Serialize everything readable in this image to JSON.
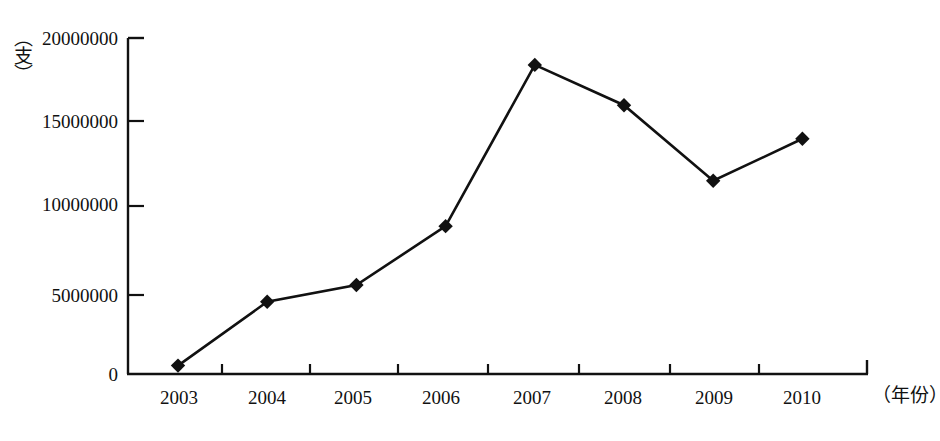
{
  "figure": {
    "background": "#ffffff",
    "ink_color": "#111111",
    "scan_artifact_top": "……………………………………",
    "scan_artifact_bottom": "………………………………………………………………"
  },
  "chart_data": {
    "type": "line",
    "title": "",
    "subtitle": "",
    "xlabel": "（年份）",
    "ylabel": "（支）",
    "categories": [
      "2003",
      "2004",
      "2005",
      "2006",
      "2007",
      "2008",
      "2009",
      "2010"
    ],
    "values": [
      500000,
      4300000,
      5300000,
      8800000,
      18400000,
      16000000,
      11500000,
      14000000
    ],
    "series": [
      {
        "name": "",
        "values": [
          500000,
          4300000,
          5300000,
          8800000,
          18400000,
          16000000,
          11500000,
          14000000
        ],
        "marker": "diamond",
        "line_color": "#111111",
        "marker_color": "#111111"
      }
    ],
    "ylim": [
      0,
      20000000
    ],
    "yticks": [
      0,
      5000000,
      10000000,
      15000000,
      20000000
    ],
    "ytick_labels": [
      "0",
      "5000000",
      "10000000",
      "15000000",
      "20000000"
    ],
    "xtick_labels": [
      "2003",
      "2004",
      "2005",
      "2006",
      "2007",
      "2008",
      "2009",
      "2010"
    ],
    "grid": false,
    "legend": null,
    "legend_position": "none",
    "annotations": []
  }
}
